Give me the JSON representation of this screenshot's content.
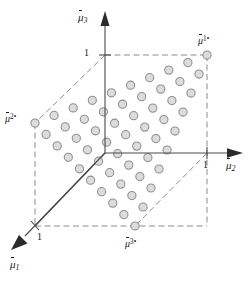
{
  "figure": {
    "axes": [
      {
        "id": "mu1",
        "base": "μ",
        "sub": "1",
        "label": "μ̃1",
        "tick_label": "1",
        "direction": "down-left"
      },
      {
        "id": "mu2",
        "base": "μ",
        "sub": "2",
        "label": "μ̃2",
        "tick_label": "1",
        "direction": "right"
      },
      {
        "id": "mu3",
        "base": "μ",
        "sub": "3",
        "label": "μ̃3",
        "tick_label": "1",
        "direction": "up"
      }
    ],
    "vertices": [
      {
        "id": "v1",
        "base": "μ",
        "sup": "1•",
        "label": "μ̃1•",
        "x": 207,
        "y": 55
      },
      {
        "id": "v2",
        "base": "μ",
        "sup": "2•",
        "label": "μ̃2•",
        "x": 35,
        "y": 123
      },
      {
        "id": "v3",
        "base": "μ",
        "sup": "3•",
        "label": "μ̃3•",
        "x": 135,
        "y": 226
      }
    ],
    "tick_labels": {
      "mu1": "1",
      "mu2": "1",
      "mu3": "1"
    },
    "colors": {
      "background": "#ffffff",
      "axis": "#4a4a4a",
      "dash": "#8c8c8c",
      "dot_fill": "#dcdcdc",
      "dot_stroke": "#8f8f8f",
      "arrow": "#2b2b2b",
      "text": "#1a1a1a"
    }
  },
  "chart_data": {
    "type": "scatter",
    "xlabel": "μ̃2",
    "ylabel": "μ̃3",
    "zlabel": "μ̃1",
    "grid": false,
    "legend": null,
    "axis_ranges": {
      "mu1": [
        0,
        1
      ],
      "mu2": [
        0,
        1
      ],
      "mu3": [
        0,
        1
      ]
    },
    "lattice": {
      "description": "Triangular lattice of points on the plane μ̃1+μ̃2+μ̃3=1, vertices at the three unit points",
      "resolution": 9,
      "point_count": 55,
      "marker": "open circle, grey fill"
    },
    "annotations": [
      {
        "text": "μ̃1•",
        "at_vertex": "mu1-unit-point"
      },
      {
        "text": "μ̃2•",
        "at_vertex": "mu2-unit-point"
      },
      {
        "text": "μ̃3•",
        "at_vertex": "mu3-unit-point"
      }
    ]
  },
  "geometry": {
    "origin": {
      "x": 105,
      "y": 153
    },
    "unit_mu1": {
      "x": 35,
      "y": 226
    },
    "unit_mu2": {
      "x": 207,
      "y": 153
    },
    "unit_mu3": {
      "x": 105,
      "y": 55
    },
    "cube_far": {
      "x": 207,
      "y": 55
    },
    "cube_lower_right": {
      "x": 207,
      "y": 226
    },
    "cube_lower_left": {
      "x": 35,
      "y": 226
    },
    "lattice_n": 9,
    "dot_radius": 4.1
  }
}
